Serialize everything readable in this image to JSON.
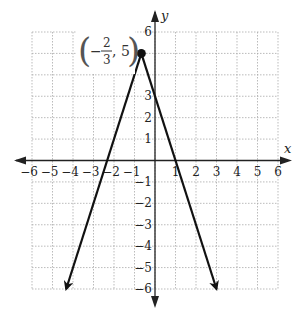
{
  "chart_data": {
    "type": "line",
    "title": "",
    "xlabel": "x",
    "ylabel": "y",
    "xlim": [
      -6,
      6
    ],
    "ylim": [
      -6,
      6
    ],
    "grid": true,
    "legend": null,
    "x_ticks": [
      -6,
      -5,
      -4,
      -3,
      -2,
      -1,
      1,
      2,
      3,
      4,
      5,
      6
    ],
    "y_ticks": [
      -6,
      -5,
      -4,
      -3,
      -2,
      -1,
      1,
      2,
      3,
      6
    ],
    "x_tick_labels": [
      "−6",
      "−5",
      "−4",
      "−3",
      "−2",
      "−1",
      "1",
      "2",
      "3",
      "4",
      "5",
      "6"
    ],
    "y_tick_labels": [
      "6",
      "3",
      "2",
      "1",
      "−1",
      "−2",
      "−3",
      "−4",
      "−5",
      "−6"
    ],
    "series": [
      {
        "name": "y = −3|x + 2/3| + 5",
        "x": [
          -4.333,
          -0.667,
          3
        ],
        "y": [
          -6,
          5,
          -6
        ],
        "arrows_at_ends": true,
        "color": "#111111"
      }
    ],
    "points": [
      {
        "x": -0.667,
        "y": 5,
        "label": "(−2/3, 5)"
      }
    ],
    "annotations": [
      {
        "text": "(−2/3, 5)",
        "x": -0.667,
        "y": 5,
        "position": "left"
      }
    ]
  },
  "labels": {
    "x_axis": "x",
    "y_axis": "y",
    "vertex_open_paren": "(",
    "vertex_minus": "−",
    "vertex_num": "2",
    "vertex_den": "3",
    "vertex_comma_y": ", 5",
    "vertex_close_paren": ")"
  },
  "colors": {
    "axis": "#222222",
    "grid": "#aaaaaa",
    "line": "#111111",
    "background": "#ffffff"
  }
}
